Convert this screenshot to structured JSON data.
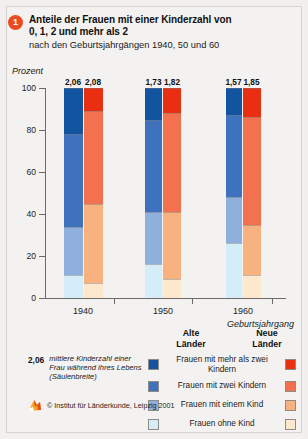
{
  "header": {
    "badge_number": "1",
    "title_line1": "Anteile der Frauen mit einer Kinderzahl von",
    "title_line2": "0, 1, 2 und mehr als 2",
    "subtitle": "nach den Geburtsjahrgängen 1940, 50 und 60",
    "unit_label": "Prozent"
  },
  "legend": {
    "col_old_line1": "Alte",
    "col_old_line2": "Länder",
    "col_new_line1": "Neue",
    "col_new_line2": "Länder",
    "items": [
      {
        "label": "Frauen mit mehr als zwei Kindern",
        "old_color": "#1254a0",
        "new_color": "#ea2e11"
      },
      {
        "label": "Frauen mit zwei Kindern",
        "old_color": "#3f72bd",
        "new_color": "#f4714f"
      },
      {
        "label": "Frauen mit einem Kind",
        "old_color": "#8fb0dd",
        "new_color": "#f7b280"
      },
      {
        "label": "Frauen ohne Kind",
        "old_color": "#d4edf8",
        "new_color": "#fbe8cd"
      }
    ],
    "note_value": "2,06",
    "note_text": "mittlere Kinderzahl einer Frau während ihres Lebens (Säulenbreite)",
    "credit": "© Institut für Länderkunde, Leipzig 2001"
  },
  "chart_data": {
    "type": "bar",
    "subtype": "stacked-100-percent",
    "title": "Anteile der Frauen mit einer Kinderzahl von 0, 1, 2 und mehr als 2",
    "subtitle": "nach den Geburtsjahrgängen 1940, 50 und 60",
    "xlabel": "Geburtsjahrgang",
    "ylabel": "Prozent",
    "ylim": [
      0,
      100
    ],
    "yticks": [
      0,
      20,
      40,
      60,
      80,
      100
    ],
    "ytick_labels": [
      "0",
      "20",
      "40",
      "60",
      "80",
      "100"
    ],
    "grid": false,
    "legend_position": "bottom",
    "categories": [
      "1940",
      "1950",
      "1960"
    ],
    "groups": [
      "Alte Länder",
      "Neue Länder"
    ],
    "stack_order_bottom_to_top": [
      "Frauen ohne Kind",
      "Frauen mit einem Kind",
      "Frauen mit zwei Kindern",
      "Frauen mit mehr als zwei Kindern"
    ],
    "series": [
      {
        "name": "Frauen ohne Kind",
        "old_values": [
          11,
          16,
          26
        ],
        "new_values": [
          7,
          9,
          11
        ],
        "old_color": "#d4edf8",
        "new_color": "#fbe8cd"
      },
      {
        "name": "Frauen mit einem Kind",
        "old_values": [
          23,
          25,
          22
        ],
        "new_values": [
          38,
          32,
          24
        ],
        "old_color": "#8fb0dd",
        "new_color": "#f7b280"
      },
      {
        "name": "Frauen mit zwei Kindern",
        "old_values": [
          44,
          44,
          39
        ],
        "new_values": [
          44,
          47,
          51
        ],
        "old_color": "#3f72bd",
        "new_color": "#f4714f"
      },
      {
        "name": "Frauen mit mehr als zwei Kindern",
        "old_values": [
          22,
          15,
          13
        ],
        "new_values": [
          11,
          12,
          14
        ],
        "old_color": "#1254a0",
        "new_color": "#ea2e11"
      }
    ],
    "bar_value_labels": {
      "old": [
        "2,06",
        "1,73",
        "1,57"
      ],
      "new": [
        "2,08",
        "1,82",
        "1,85"
      ]
    },
    "bar_width_meaning": "Säulenbreite = mittlere Kinderzahl einer Frau während ihres Lebens"
  }
}
